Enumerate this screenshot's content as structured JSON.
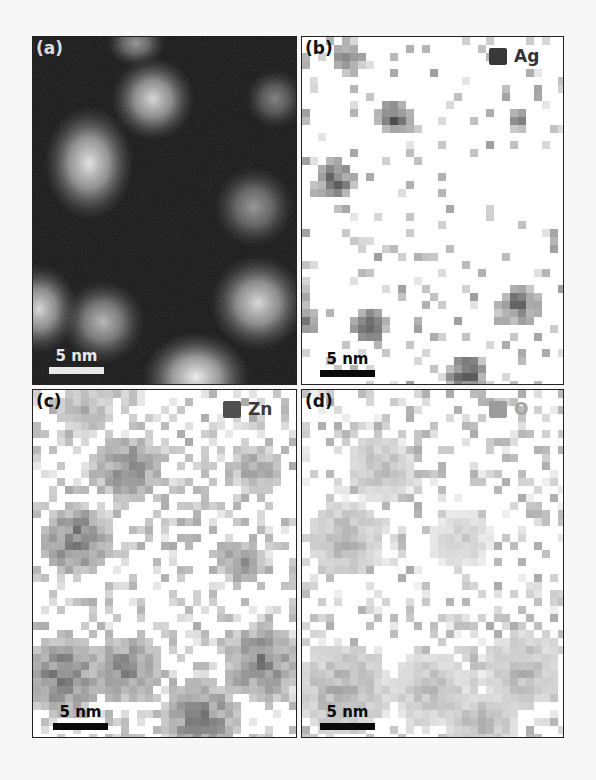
{
  "figure": {
    "background": "#f7f7f7",
    "panels": [
      {
        "id": "a",
        "label": "(a)",
        "type": "haadf-stem",
        "box": {
          "x": 32,
          "y": 36,
          "w": 265,
          "h": 349
        },
        "background": "#141414",
        "label_color": "#dddddd",
        "scale_bar": {
          "text": "5 nm",
          "length_px": 55,
          "color": "#e8e8e8",
          "x": 16,
          "y": 311
        },
        "particles": [
          {
            "cx": 103,
            "cy": 6,
            "rx": 20,
            "ry": 16,
            "intensity": 0.55
          },
          {
            "cx": 120,
            "cy": 62,
            "rx": 28,
            "ry": 28,
            "intensity": 0.85
          },
          {
            "cx": 242,
            "cy": 62,
            "rx": 20,
            "ry": 20,
            "intensity": 0.45
          },
          {
            "cx": 56,
            "cy": 126,
            "rx": 30,
            "ry": 38,
            "intensity": 0.9
          },
          {
            "cx": 221,
            "cy": 170,
            "rx": 27,
            "ry": 27,
            "intensity": 0.55
          },
          {
            "cx": 6,
            "cy": 272,
            "rx": 26,
            "ry": 30,
            "intensity": 0.85
          },
          {
            "cx": 70,
            "cy": 285,
            "rx": 28,
            "ry": 28,
            "intensity": 0.7
          },
          {
            "cx": 225,
            "cy": 266,
            "rx": 32,
            "ry": 32,
            "intensity": 0.85
          },
          {
            "cx": 163,
            "cy": 340,
            "rx": 36,
            "ry": 30,
            "intensity": 0.95
          }
        ]
      },
      {
        "id": "b",
        "label": "(b)",
        "type": "edx-map",
        "element": "Ag",
        "box": {
          "x": 301,
          "y": 36,
          "w": 263,
          "h": 349
        },
        "map_color": "#333333",
        "legend": {
          "label": "Ag",
          "swatch_color": "#383838",
          "text_color": "#333333",
          "x": 187
        },
        "label_color": "#111111",
        "scale_bar": {
          "text": "5 nm",
          "length_px": 55,
          "color": "#0a0a0a",
          "x": 18,
          "y": 314
        },
        "cell": 8,
        "noise": 0.12,
        "noise_max": 0.35,
        "seed": 11,
        "clusters": [
          {
            "cx": 46,
            "cy": 22,
            "r": 16,
            "peak": 0.9
          },
          {
            "cx": 92,
            "cy": 82,
            "r": 18,
            "peak": 1.0
          },
          {
            "cx": 216,
            "cy": 84,
            "r": 12,
            "peak": 0.8
          },
          {
            "cx": 34,
            "cy": 143,
            "r": 20,
            "peak": 1.0
          },
          {
            "cx": 4,
            "cy": 282,
            "r": 16,
            "peak": 0.95
          },
          {
            "cx": 68,
            "cy": 288,
            "r": 20,
            "peak": 1.0
          },
          {
            "cx": 218,
            "cy": 268,
            "r": 20,
            "peak": 1.0
          },
          {
            "cx": 165,
            "cy": 338,
            "r": 22,
            "peak": 1.0
          }
        ]
      },
      {
        "id": "c",
        "label": "(c)",
        "type": "edx-map",
        "element": "Zn",
        "box": {
          "x": 32,
          "y": 389,
          "w": 265,
          "h": 349
        },
        "map_color": "#4a4a4a",
        "legend": {
          "label": "Zn",
          "swatch_color": "#505050",
          "text_color": "#3a3a3a",
          "x": 190
        },
        "label_color": "#111111",
        "scale_bar": {
          "text": "5 nm",
          "length_px": 55,
          "color": "#0a0a0a",
          "x": 20,
          "y": 314
        },
        "cell": 8,
        "noise": 0.35,
        "noise_max": 0.35,
        "seed": 23,
        "clusters": [
          {
            "cx": 52,
            "cy": 20,
            "r": 28,
            "peak": 0.6
          },
          {
            "cx": 96,
            "cy": 78,
            "r": 34,
            "peak": 0.9
          },
          {
            "cx": 224,
            "cy": 80,
            "r": 26,
            "peak": 0.7
          },
          {
            "cx": 44,
            "cy": 150,
            "r": 36,
            "peak": 0.95
          },
          {
            "cx": 208,
            "cy": 172,
            "r": 22,
            "peak": 0.85
          },
          {
            "cx": 30,
            "cy": 286,
            "r": 42,
            "peak": 0.95
          },
          {
            "cx": 94,
            "cy": 280,
            "r": 36,
            "peak": 0.85
          },
          {
            "cx": 228,
            "cy": 272,
            "r": 38,
            "peak": 0.95
          },
          {
            "cx": 168,
            "cy": 330,
            "r": 40,
            "peak": 0.9
          }
        ]
      },
      {
        "id": "d",
        "label": "(d)",
        "type": "edx-map",
        "element": "O",
        "box": {
          "x": 301,
          "y": 389,
          "w": 263,
          "h": 349
        },
        "map_color": "#8a8a8a",
        "legend": {
          "label": "O",
          "swatch_color": "#9c9c9c",
          "text_color": "#a5a5a5",
          "x": 187
        },
        "label_color": "#111111",
        "scale_bar": {
          "text": "5 nm",
          "length_px": 55,
          "color": "#0a0a0a",
          "x": 18,
          "y": 314
        },
        "cell": 8,
        "noise": 0.3,
        "noise_max": 0.6,
        "seed": 37,
        "clusters": [
          {
            "cx": 78,
            "cy": 78,
            "r": 34,
            "peak": 0.75
          },
          {
            "cx": 44,
            "cy": 150,
            "r": 38,
            "peak": 0.85
          },
          {
            "cx": 160,
            "cy": 150,
            "r": 30,
            "peak": 0.55
          },
          {
            "cx": 40,
            "cy": 300,
            "r": 48,
            "peak": 0.9
          },
          {
            "cx": 130,
            "cy": 300,
            "r": 40,
            "peak": 0.75
          },
          {
            "cx": 220,
            "cy": 280,
            "r": 38,
            "peak": 0.85
          },
          {
            "cx": 180,
            "cy": 336,
            "r": 36,
            "peak": 0.8
          }
        ]
      }
    ]
  }
}
